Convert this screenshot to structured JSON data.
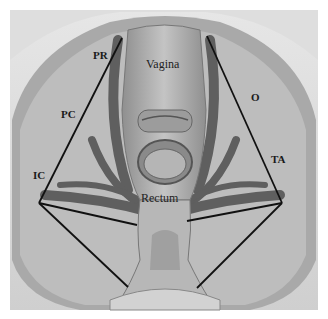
{
  "figure": {
    "labels": {
      "vagina": "Vagina",
      "rectum": "Rectum",
      "pr": "PR",
      "pc": "PC",
      "ic": "IC",
      "o": "O",
      "ta": "TA"
    },
    "colors": {
      "background": "#bdbdbd",
      "outer_frame": "#d9d9d9",
      "muscle": "#5e5e5e",
      "organ": "#a8a8a8",
      "lines": "#111111"
    }
  }
}
